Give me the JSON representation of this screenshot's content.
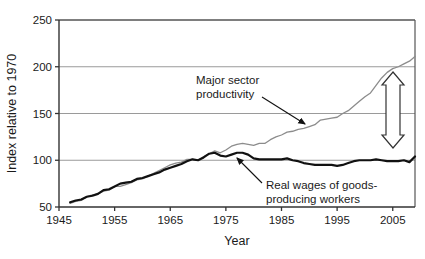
{
  "chart_data": {
    "type": "line",
    "title": "",
    "xlabel": "Year",
    "ylabel": "Index relative to 1970",
    "xlim": [
      1945,
      2009
    ],
    "ylim": [
      50,
      250
    ],
    "yticks": [
      50,
      100,
      150,
      200,
      250
    ],
    "xticks": [
      1945,
      1955,
      1965,
      1975,
      1985,
      1995,
      2005
    ],
    "ytick_labels": [
      "50",
      "100",
      "150",
      "200",
      "250"
    ],
    "xtick_labels": [
      "1945",
      "1955",
      "1965",
      "1975",
      "1985",
      "1995",
      "2005"
    ],
    "grid": "horizontal",
    "legend": "none",
    "series": [
      {
        "name": "Major sector productivity",
        "color": "#8c8c8c",
        "width": 1.3,
        "points": [
          [
            1947,
            54
          ],
          [
            1948,
            56
          ],
          [
            1949,
            57
          ],
          [
            1950,
            61
          ],
          [
            1951,
            63
          ],
          [
            1952,
            64
          ],
          [
            1953,
            67
          ],
          [
            1954,
            68
          ],
          [
            1955,
            72
          ],
          [
            1956,
            72
          ],
          [
            1957,
            74
          ],
          [
            1958,
            76
          ],
          [
            1959,
            79
          ],
          [
            1960,
            80
          ],
          [
            1961,
            83
          ],
          [
            1962,
            86
          ],
          [
            1963,
            89
          ],
          [
            1964,
            92
          ],
          [
            1965,
            95
          ],
          [
            1966,
            97
          ],
          [
            1967,
            98
          ],
          [
            1968,
            101
          ],
          [
            1969,
            101
          ],
          [
            1970,
            100
          ],
          [
            1971,
            104
          ],
          [
            1972,
            107
          ],
          [
            1973,
            110
          ],
          [
            1974,
            108
          ],
          [
            1975,
            111
          ],
          [
            1976,
            115
          ],
          [
            1977,
            117
          ],
          [
            1978,
            118
          ],
          [
            1979,
            117
          ],
          [
            1980,
            116
          ],
          [
            1981,
            118
          ],
          [
            1982,
            118
          ],
          [
            1983,
            122
          ],
          [
            1984,
            125
          ],
          [
            1985,
            127
          ],
          [
            1986,
            130
          ],
          [
            1987,
            131
          ],
          [
            1988,
            133
          ],
          [
            1989,
            134
          ],
          [
            1990,
            136
          ],
          [
            1991,
            138
          ],
          [
            1992,
            143
          ],
          [
            1993,
            144
          ],
          [
            1994,
            145
          ],
          [
            1995,
            146
          ],
          [
            1996,
            150
          ],
          [
            1997,
            153
          ],
          [
            1998,
            158
          ],
          [
            1999,
            163
          ],
          [
            2000,
            168
          ],
          [
            2001,
            172
          ],
          [
            2002,
            180
          ],
          [
            2003,
            188
          ],
          [
            2004,
            194
          ],
          [
            2005,
            198
          ],
          [
            2006,
            200
          ],
          [
            2007,
            203
          ],
          [
            2008,
            206
          ],
          [
            2009,
            211
          ]
        ]
      },
      {
        "name": "Real wages of goods-producing workers",
        "color": "#111111",
        "width": 2.2,
        "points": [
          [
            1947,
            55
          ],
          [
            1948,
            57
          ],
          [
            1949,
            58
          ],
          [
            1950,
            61
          ],
          [
            1951,
            62
          ],
          [
            1952,
            64
          ],
          [
            1953,
            68
          ],
          [
            1954,
            69
          ],
          [
            1955,
            72
          ],
          [
            1956,
            75
          ],
          [
            1957,
            76
          ],
          [
            1958,
            77
          ],
          [
            1959,
            80
          ],
          [
            1960,
            81
          ],
          [
            1961,
            83
          ],
          [
            1962,
            85
          ],
          [
            1963,
            87
          ],
          [
            1964,
            90
          ],
          [
            1965,
            92
          ],
          [
            1966,
            94
          ],
          [
            1967,
            96
          ],
          [
            1968,
            99
          ],
          [
            1969,
            101
          ],
          [
            1970,
            100
          ],
          [
            1971,
            103
          ],
          [
            1972,
            107
          ],
          [
            1973,
            108
          ],
          [
            1974,
            105
          ],
          [
            1975,
            104
          ],
          [
            1976,
            106
          ],
          [
            1977,
            108
          ],
          [
            1978,
            108
          ],
          [
            1979,
            106
          ],
          [
            1980,
            102
          ],
          [
            1981,
            101
          ],
          [
            1982,
            101
          ],
          [
            1983,
            101
          ],
          [
            1984,
            101
          ],
          [
            1985,
            101
          ],
          [
            1986,
            102
          ],
          [
            1987,
            100
          ],
          [
            1988,
            99
          ],
          [
            1989,
            97
          ],
          [
            1990,
            96
          ],
          [
            1991,
            95
          ],
          [
            1992,
            95
          ],
          [
            1993,
            95
          ],
          [
            1994,
            95
          ],
          [
            1995,
            94
          ],
          [
            1996,
            95
          ],
          [
            1997,
            97
          ],
          [
            1998,
            99
          ],
          [
            1999,
            100
          ],
          [
            2000,
            100
          ],
          [
            2001,
            100
          ],
          [
            2002,
            101
          ],
          [
            2003,
            100
          ],
          [
            2004,
            99
          ],
          [
            2005,
            99
          ],
          [
            2006,
            99
          ],
          [
            2007,
            100
          ],
          [
            2008,
            98
          ],
          [
            2009,
            104
          ]
        ]
      }
    ],
    "annotations": [
      {
        "name": "productivity-annotation",
        "text_line1": "Major sector",
        "text_line2": "productivity",
        "text_x": 196,
        "text_y": 84,
        "arrow_from": [
          262,
          97
        ],
        "arrow_to": [
          305,
          124
        ]
      },
      {
        "name": "wages-annotation",
        "text_line1": "Real wages of goods-",
        "text_line2": "producing workers",
        "text_x": 266,
        "text_y": 189,
        "arrow_from": [
          262,
          183
        ],
        "arrow_to": [
          237,
          158
        ]
      },
      {
        "name": "gap-double-arrow",
        "type": "double-headed-arrow",
        "x": 393,
        "y_top": 72,
        "y_bottom": 148
      }
    ]
  }
}
